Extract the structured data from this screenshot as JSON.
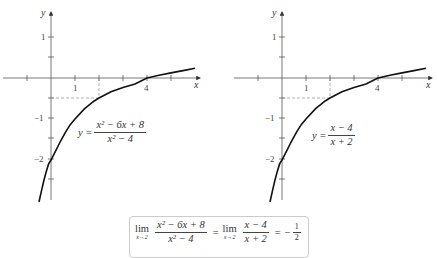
{
  "figure": {
    "left_graph": {
      "x_axis_label": "x",
      "y_axis_label": "y",
      "x_tick_labels": [
        "1",
        "4"
      ],
      "y_tick_labels": [
        "1",
        "−1",
        "−2"
      ],
      "equation": {
        "lhs": "y =",
        "numerator": "x² − 6x + 8",
        "denominator": "x² − 4"
      }
    },
    "right_graph": {
      "x_axis_label": "x",
      "y_axis_label": "y",
      "x_tick_labels": [
        "1",
        "4"
      ],
      "y_tick_labels": [
        "1",
        "−1",
        "−2"
      ],
      "equation": {
        "lhs": "y =",
        "numerator": "x − 4",
        "denominator": "x + 2"
      }
    },
    "limit_statement": {
      "lim_word": "lim",
      "lim_sub": "x→2",
      "frac1_num": "x² − 6x + 8",
      "frac1_den": "x² − 4",
      "equals1": "=",
      "frac2_num": "x − 4",
      "frac2_den": "x + 2",
      "equals2": "=",
      "minus": "−",
      "result_num": "1",
      "result_den": "2"
    }
  },
  "colors": {
    "curve": "#111111",
    "axis": "#555555",
    "dashed": "#888888",
    "box_border": "#cccccc"
  }
}
